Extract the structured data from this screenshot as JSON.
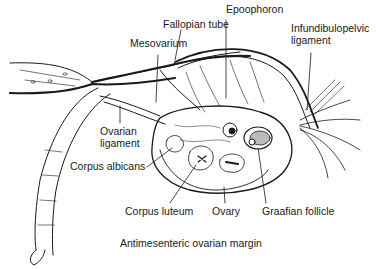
{
  "diagram": {
    "labels": [
      {
        "id": "fallopian-tube",
        "text": "Fallopian tube",
        "x": 163,
        "y": 24
      },
      {
        "id": "epoophoron",
        "text": "Epoophoron",
        "x": 226,
        "y": 9
      },
      {
        "id": "infundibulopelvic-ligament-1",
        "text": "Infundibulopelvic",
        "x": 291,
        "y": 28
      },
      {
        "id": "infundibulopelvic-ligament-2",
        "text": "ligament",
        "x": 291,
        "y": 40
      },
      {
        "id": "mesovarium",
        "text": "Mesovarium",
        "x": 130,
        "y": 43
      },
      {
        "id": "ovarian-ligament-1",
        "text": "Ovarian",
        "x": 100,
        "y": 131
      },
      {
        "id": "ovarian-ligament-2",
        "text": "ligament",
        "x": 100,
        "y": 143
      },
      {
        "id": "corpus-albicans",
        "text": "Corpus albicans",
        "x": 70,
        "y": 163
      },
      {
        "id": "corpus-luteum",
        "text": "Corpus luteum",
        "x": 125,
        "y": 205
      },
      {
        "id": "ovary",
        "text": "Ovary",
        "x": 212,
        "y": 205
      },
      {
        "id": "graafian-follicle",
        "text": "Graafian follicle",
        "x": 262,
        "y": 205
      },
      {
        "id": "antimesenteric-ovarian-margin",
        "text": "Antimesenteric ovarian margin",
        "x": 120,
        "y": 237
      }
    ]
  }
}
